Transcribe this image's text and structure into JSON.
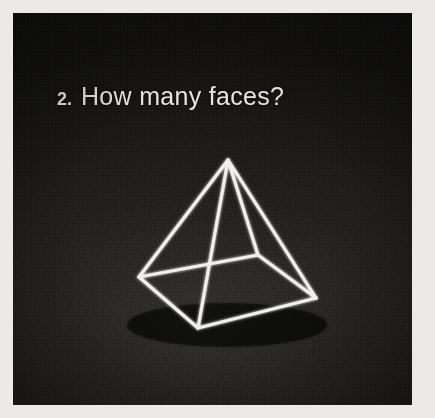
{
  "card": {
    "border_color": "#eceae7",
    "photo_background": "#23211f"
  },
  "question": {
    "number": "2.",
    "text": "How many faces?",
    "color": "#e8e7e4"
  },
  "figure": {
    "name": "square-pyramid-wireframe",
    "line_color": "#f0efec",
    "vertices": {
      "apex": [
        215,
        147
      ],
      "left": [
        126,
        264
      ],
      "back": [
        245,
        242
      ],
      "right": [
        303,
        285
      ],
      "front": [
        185,
        315
      ]
    },
    "edges": [
      [
        "apex",
        "left"
      ],
      [
        "apex",
        "right"
      ],
      [
        "apex",
        "front"
      ],
      [
        "apex",
        "back"
      ],
      [
        "left",
        "back"
      ],
      [
        "back",
        "right"
      ],
      [
        "right",
        "front"
      ],
      [
        "front",
        "left"
      ]
    ]
  }
}
